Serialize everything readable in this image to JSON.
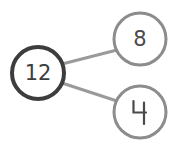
{
  "diagram": {
    "type": "number-bond",
    "background_color": "#ffffff",
    "width": 171,
    "height": 150,
    "root": {
      "id": "node-total",
      "label": "12",
      "cx": 38,
      "cy": 73,
      "r": 26,
      "stroke_color": "#3d3d3d",
      "stroke_width": 4,
      "fill_color": "#ffffff",
      "text_color": "#3d3d3d",
      "font_size": 21
    },
    "children": [
      {
        "id": "node-part-1",
        "label": "8",
        "cx": 140,
        "cy": 39,
        "r": 26,
        "stroke_color": "#8c8c8c",
        "stroke_width": 3,
        "fill_color": "#ffffff",
        "text_color": "#4a4a4a",
        "font_size": 21
      },
      {
        "id": "node-part-2",
        "label": "4",
        "label_style": "open-top-four",
        "cx": 140,
        "cy": 112,
        "r": 26,
        "stroke_color": "#8c8c8c",
        "stroke_width": 3,
        "fill_color": "#ffffff",
        "text_color": "#4a4a4a",
        "font_size": 21
      }
    ],
    "edges": [
      {
        "id": "edge-total-to-part-1",
        "from": "node-total",
        "to": "node-part-1",
        "x1": 62,
        "y1": 64,
        "x2": 117,
        "y2": 50,
        "color": "#9a9a9a",
        "width": 3
      },
      {
        "id": "edge-total-to-part-2",
        "from": "node-total",
        "to": "node-part-2",
        "x1": 62,
        "y1": 83,
        "x2": 117,
        "y2": 101,
        "color": "#9a9a9a",
        "width": 3
      }
    ]
  }
}
